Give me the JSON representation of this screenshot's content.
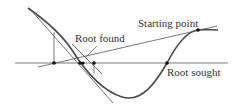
{
  "diagram": {
    "type": "newton-raphson-failure",
    "labels": {
      "starting_point": "Starting point",
      "root_found": "Root found",
      "root_sought": "Root sought"
    },
    "colors": {
      "curve": "#4a4a4a",
      "lines": "#555555",
      "points": "#111111",
      "text": "#333333",
      "background": "#ffffff"
    }
  }
}
